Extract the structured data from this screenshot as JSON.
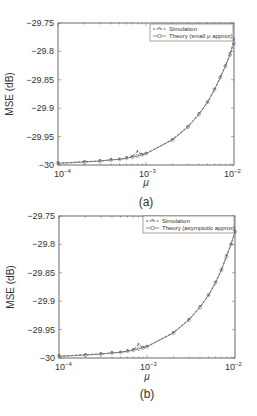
{
  "chart_data": [
    {
      "type": "line",
      "panel_label": "(a)",
      "title": "",
      "xlabel": "μ",
      "ylabel": "MSE (dB)",
      "xscale": "log",
      "xlim": [
        0.0001,
        0.01
      ],
      "ylim": [
        -30,
        -29.75
      ],
      "x_ticks": [
        "10^-4",
        "10^-3",
        "10^-2"
      ],
      "y_ticks": [
        "-29.75",
        "-29.8",
        "-29.85",
        "-29.9",
        "-29.95",
        "-30"
      ],
      "grid": false,
      "legend_position": "upper right",
      "x": [
        0.0001,
        0.0002,
        0.0003,
        0.0004,
        0.0005,
        0.0006,
        0.0007,
        0.0008,
        0.0009,
        0.001,
        0.002,
        0.003,
        0.004,
        0.005,
        0.006,
        0.007,
        0.008,
        0.009,
        0.01
      ],
      "series": [
        {
          "name": "Simulation",
          "style": "dashed-star",
          "values": [
            -29.997,
            -29.994,
            -29.993,
            -29.991,
            -29.99,
            -29.988,
            -29.985,
            -29.976,
            -29.982,
            -29.98,
            -29.955,
            -29.932,
            -29.91,
            -29.89,
            -29.868,
            -29.845,
            -29.825,
            -29.805,
            -29.78
          ]
        },
        {
          "name": "Theory (small μ approx)",
          "style": "solid-circle",
          "values": [
            -29.997,
            -29.995,
            -29.993,
            -29.991,
            -29.99,
            -29.988,
            -29.986,
            -29.984,
            -29.982,
            -29.98,
            -29.956,
            -29.933,
            -29.911,
            -29.889,
            -29.867,
            -29.846,
            -29.826,
            -29.806,
            -29.786
          ]
        }
      ]
    },
    {
      "type": "line",
      "panel_label": "(b)",
      "title": "",
      "xlabel": "μ",
      "ylabel": "MSE (dB)",
      "xscale": "log",
      "xlim": [
        0.0001,
        0.01
      ],
      "ylim": [
        -30,
        -29.75
      ],
      "x_ticks": [
        "10^-4",
        "10^-3",
        "10^-2"
      ],
      "y_ticks": [
        "-29.75",
        "-29.8",
        "-29.85",
        "-29.9",
        "-29.95",
        "-30"
      ],
      "grid": false,
      "legend_position": "upper right",
      "x": [
        0.0001,
        0.0002,
        0.0003,
        0.0004,
        0.0005,
        0.0006,
        0.0007,
        0.0008,
        0.0009,
        0.001,
        0.002,
        0.003,
        0.004,
        0.005,
        0.006,
        0.007,
        0.008,
        0.009,
        0.01
      ],
      "series": [
        {
          "name": "Simulation",
          "style": "dashed-star",
          "values": [
            -29.997,
            -29.994,
            -29.993,
            -29.991,
            -29.99,
            -29.988,
            -29.986,
            -29.976,
            -29.982,
            -29.98,
            -29.955,
            -29.932,
            -29.91,
            -29.89,
            -29.868,
            -29.845,
            -29.82,
            -29.8,
            -29.778
          ]
        },
        {
          "name": "Theory (asymptotic approx)",
          "style": "solid-circle",
          "values": [
            -29.997,
            -29.995,
            -29.993,
            -29.991,
            -29.99,
            -29.988,
            -29.986,
            -29.984,
            -29.982,
            -29.98,
            -29.956,
            -29.933,
            -29.911,
            -29.889,
            -29.867,
            -29.845,
            -29.822,
            -29.8,
            -29.778
          ]
        }
      ]
    }
  ],
  "panels": [
    {
      "caption": "(a)",
      "xlabel": "μ",
      "ylabel": "MSE (dB)",
      "ytick_labels": [
        "−29.75",
        "−29.8",
        "−29.85",
        "−29.9",
        "−29.95",
        "−30"
      ],
      "xtick_bases": [
        "10",
        "10",
        "10"
      ],
      "xtick_exps": [
        "−4",
        "−3",
        "−2"
      ],
      "legend": [
        "Simulation",
        "Theory (small μ approx)"
      ]
    },
    {
      "caption": "(b)",
      "xlabel": "μ",
      "ylabel": "MSE (dB)",
      "ytick_labels": [
        "−29.75",
        "−29.8",
        "−29.85",
        "−29.9",
        "−29.95",
        "−30"
      ],
      "xtick_bases": [
        "10",
        "10",
        "10"
      ],
      "xtick_exps": [
        "−4",
        "−3",
        "−2"
      ],
      "legend": [
        "Simulation",
        "Theory (asymptotic approx)"
      ]
    }
  ],
  "colors": {
    "axis": "#444444",
    "simulation": "#333333",
    "theory": "#777777",
    "background": "#ffffff"
  }
}
